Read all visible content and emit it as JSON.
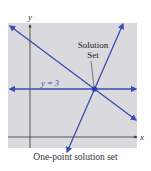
{
  "figure": {
    "caption": "One-point solution set",
    "axis_labels": {
      "x": "x",
      "y": "y"
    },
    "annotation": "Solution Set",
    "annotation_lines": [
      "Solution",
      "Set"
    ],
    "horizontal_line_label": "y = 3",
    "colors": {
      "background_panel": "#d9d9de",
      "line": "#3b4cb0",
      "axis": "#333333",
      "text": "#333333"
    }
  }
}
